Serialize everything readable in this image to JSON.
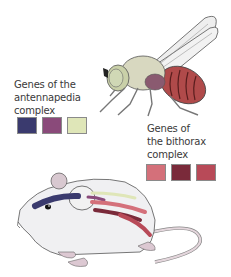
{
  "figure": {
    "antennapedia": {
      "label_lines": [
        "Genes of the",
        "antennapedia",
        "complex"
      ],
      "swatches": [
        {
          "name": "antp-gene-1",
          "color": "#3a3a6e"
        },
        {
          "name": "antp-gene-2",
          "color": "#8a4a7a"
        },
        {
          "name": "antp-gene-3",
          "color": "#dfe6b8"
        }
      ]
    },
    "bithorax": {
      "label_lines": [
        "Genes of",
        "the bithorax",
        "complex"
      ],
      "swatches": [
        {
          "name": "bx-gene-1",
          "color": "#d4707a"
        },
        {
          "name": "bx-gene-2",
          "color": "#7a2a3a"
        },
        {
          "name": "bx-gene-3",
          "color": "#b84a58"
        }
      ]
    },
    "organisms": [
      "fruit-fly",
      "mouse"
    ]
  }
}
